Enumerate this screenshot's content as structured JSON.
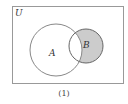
{
  "diagram": {
    "type": "venn",
    "universe_label": "U",
    "sets": [
      {
        "name": "A",
        "label": "A"
      },
      {
        "name": "B",
        "label": "B"
      }
    ],
    "shaded_region": "B minus A",
    "caption": "(1)",
    "colors": {
      "stroke": "#888888",
      "shade": "#cccccc",
      "background": "#ffffff"
    }
  }
}
